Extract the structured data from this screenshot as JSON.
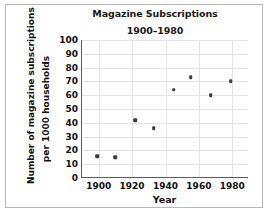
{
  "chart_data": {
    "type": "scatter",
    "title": "Magazine Subscriptions",
    "subtitle": "1900–1980",
    "xlabel": "Year",
    "ylabel_line1": "Number of magazine subscriptions",
    "ylabel_line2": "per 1000 households",
    "xlim": [
      1890,
      1990
    ],
    "ylim": [
      0,
      100
    ],
    "xticks": [
      1900,
      1920,
      1940,
      1960,
      1980
    ],
    "xtick_labels": [
      "1900",
      "1920",
      "1940",
      "1960",
      "1980"
    ],
    "yticks": [
      0,
      10,
      20,
      30,
      40,
      50,
      60,
      70,
      80,
      90,
      100
    ],
    "ytick_labels": [
      "0",
      "10",
      "20",
      "30",
      "40",
      "50",
      "60",
      "70",
      "80",
      "90",
      "100"
    ],
    "grid": true,
    "legend": "none",
    "marker_color": "#3b3b3b",
    "points": [
      {
        "x": 1899,
        "y": 16
      },
      {
        "x": 1910,
        "y": 15
      },
      {
        "x": 1922,
        "y": 42
      },
      {
        "x": 1933,
        "y": 36
      },
      {
        "x": 1945,
        "y": 64
      },
      {
        "x": 1955,
        "y": 73
      },
      {
        "x": 1967,
        "y": 60
      },
      {
        "x": 1979,
        "y": 70
      }
    ]
  }
}
